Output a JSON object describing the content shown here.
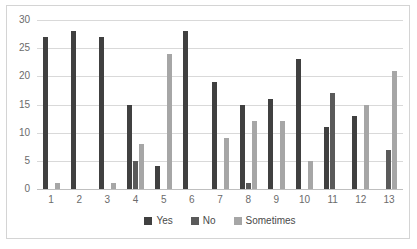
{
  "chart_data": {
    "type": "bar",
    "title": "",
    "subtitle": "",
    "xlabel": "",
    "ylabel": "",
    "categories": [
      "1",
      "2",
      "3",
      "4",
      "5",
      "6",
      "7",
      "8",
      "9",
      "10",
      "11",
      "12",
      "13"
    ],
    "series": [
      {
        "name": "Yes",
        "color": "#404040",
        "values": [
          27,
          28,
          27,
          15,
          4,
          28,
          19,
          15,
          16,
          23,
          11,
          13,
          0
        ]
      },
      {
        "name": "No",
        "color": "#5a5a5a",
        "values": [
          0,
          0,
          0,
          5,
          0,
          0,
          0,
          1,
          0,
          0,
          17,
          0,
          7
        ]
      },
      {
        "name": "Sometimes",
        "color": "#a6a6a6",
        "values": [
          1,
          0,
          1,
          8,
          24,
          0,
          9,
          12,
          12,
          5,
          0,
          15,
          21
        ]
      }
    ],
    "ylim": [
      0,
      30
    ],
    "yticks": [
      0,
      5,
      10,
      15,
      20,
      25,
      30
    ],
    "grid": true,
    "legend_position": "bottom"
  }
}
